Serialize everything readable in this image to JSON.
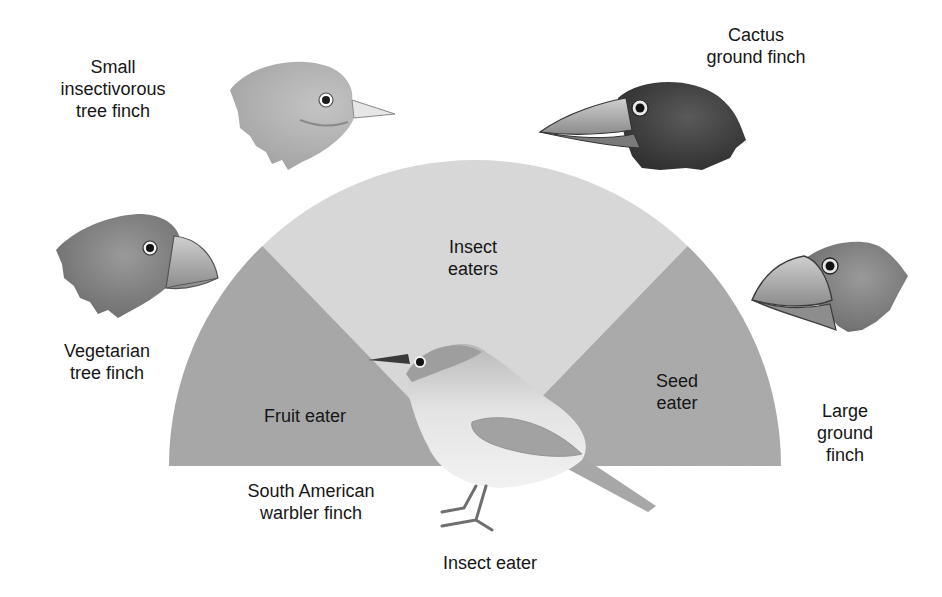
{
  "diagram": {
    "title": "",
    "colors": {
      "background": "#ffffff",
      "insect_sector": "#d9d9d9",
      "fruit_sector": "#a8a8a8",
      "seed_sector": "#ababab",
      "label_text": "#161616"
    },
    "semicircle": {
      "center_x": 475,
      "center_y": 466,
      "radius": 306,
      "sectors": [
        {
          "id": "fruit",
          "label": "Fruit eater",
          "start_deg": 134,
          "end_deg": 180,
          "color": "#a8a8a8"
        },
        {
          "id": "insect",
          "label": "Insect\neaters",
          "start_deg": 46,
          "end_deg": 134,
          "color": "#d9d9d9"
        },
        {
          "id": "seed",
          "label": "Seed\neater",
          "start_deg": 0,
          "end_deg": 46,
          "color": "#ababab"
        }
      ]
    },
    "birds": [
      {
        "id": "small-insectivorous-tree-finch",
        "label": "Small\ninsectivorous\ntree finch",
        "beak": "thin pointed"
      },
      {
        "id": "cactus-ground-finch",
        "label": "Cactus\nground finch",
        "beak": "long pointed"
      },
      {
        "id": "vegetarian-tree-finch",
        "label": "Vegetarian\ntree finch",
        "beak": "short stout curved"
      },
      {
        "id": "large-ground-finch",
        "label": "Large\nground\nfinch",
        "beak": "large thick"
      },
      {
        "id": "south-american-warbler-finch",
        "label": "South American\nwarbler finch",
        "beak": "thin"
      }
    ],
    "center_bird_caption": "Insect eater"
  }
}
